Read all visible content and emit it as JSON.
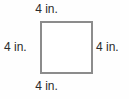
{
  "figure": {
    "shape": "square",
    "shape_fill": "#ffffff",
    "shape_stroke": "#8c8c8c",
    "text_color": "#2b2b2b",
    "background": "#fefefe",
    "labels": {
      "top": "4 in.",
      "right": "4 in.",
      "bottom": "4 in.",
      "left": "4 in."
    }
  },
  "chart_data": {
    "type": "diagram",
    "title": "",
    "shape": "square",
    "side_length": 4,
    "units": "in.",
    "sides": [
      {
        "position": "top",
        "label": "4 in.",
        "value": 4,
        "unit": "in."
      },
      {
        "position": "right",
        "label": "4 in.",
        "value": 4,
        "unit": "in."
      },
      {
        "position": "bottom",
        "label": "4 in.",
        "value": 4,
        "unit": "in."
      },
      {
        "position": "left",
        "label": "4 in.",
        "value": 4,
        "unit": "in."
      }
    ]
  }
}
